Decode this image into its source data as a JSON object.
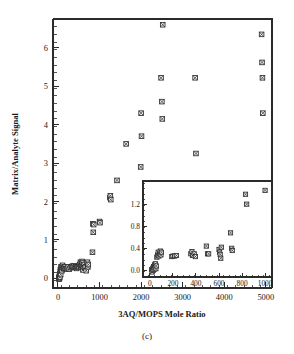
{
  "figure": {
    "caption": "(c)",
    "background_color": "#ffffff",
    "marker_color": "#2e2e2e",
    "marker_fill": "#f2f2f2",
    "axis_color": "#2b2b2b"
  },
  "chart_data": {
    "type": "scatter",
    "title": "",
    "xlabel": "3AQ/MOPS Mole Ratio",
    "ylabel": "Matrix/Analyte Signal",
    "xlim": [
      -120,
      5150
    ],
    "ylim": [
      -0.25,
      6.75
    ],
    "xticks": [
      0,
      1000,
      2000,
      3000,
      4000,
      5000
    ],
    "xticklabels": [
      "0",
      "1000",
      "2000",
      "3000",
      "4000",
      "5000"
    ],
    "yticks": [
      0,
      1,
      2,
      3,
      4,
      5,
      6
    ],
    "yticklabels": [
      "0",
      "1",
      "2",
      "3",
      "4",
      "5",
      "6"
    ],
    "minor_ticks": true,
    "grid": false,
    "legend": null,
    "marker": "crossed-square",
    "points": [
      [
        20,
        0.02
      ],
      [
        25,
        -0.02
      ],
      [
        30,
        0.05
      ],
      [
        35,
        0.0
      ],
      [
        40,
        0.08
      ],
      [
        45,
        0.03
      ],
      [
        50,
        0.12
      ],
      [
        55,
        0.18
      ],
      [
        60,
        0.22
      ],
      [
        65,
        0.1
      ],
      [
        70,
        0.26
      ],
      [
        75,
        0.3
      ],
      [
        85,
        0.24
      ],
      [
        95,
        0.2
      ],
      [
        100,
        0.3
      ],
      [
        110,
        0.34
      ],
      [
        120,
        0.28
      ],
      [
        140,
        0.26
      ],
      [
        160,
        0.3
      ],
      [
        180,
        0.25
      ],
      [
        200,
        0.25
      ],
      [
        215,
        0.26
      ],
      [
        240,
        0.3
      ],
      [
        270,
        0.24
      ],
      [
        300,
        0.28
      ],
      [
        330,
        0.3
      ],
      [
        350,
        0.32
      ],
      [
        370,
        0.3
      ],
      [
        390,
        0.33
      ],
      [
        410,
        0.28
      ],
      [
        430,
        0.3
      ],
      [
        450,
        0.26
      ],
      [
        470,
        0.3
      ],
      [
        490,
        0.31
      ],
      [
        500,
        0.3
      ],
      [
        520,
        0.36
      ],
      [
        540,
        0.42
      ],
      [
        550,
        0.3
      ],
      [
        560,
        0.38
      ],
      [
        570,
        0.34
      ],
      [
        580,
        0.44
      ],
      [
        590,
        0.4
      ],
      [
        600,
        0.22
      ],
      [
        610,
        0.3
      ],
      [
        620,
        0.36
      ],
      [
        640,
        0.28
      ],
      [
        660,
        0.3
      ],
      [
        680,
        0.2
      ],
      [
        700,
        0.4
      ],
      [
        710,
        0.42
      ],
      [
        720,
        0.3
      ],
      [
        730,
        0.36
      ],
      [
        830,
        0.68
      ],
      [
        840,
        1.42
      ],
      [
        850,
        1.2
      ],
      [
        860,
        1.4
      ],
      [
        1000,
        1.48
      ],
      [
        1010,
        1.45
      ],
      [
        1250,
        2.1
      ],
      [
        1260,
        2.15
      ],
      [
        1270,
        2.05
      ],
      [
        1420,
        2.55
      ],
      [
        1640,
        3.5
      ],
      [
        1990,
        2.9
      ],
      [
        2000,
        4.3
      ],
      [
        2010,
        3.7
      ],
      [
        2480,
        5.22
      ],
      [
        2500,
        4.6
      ],
      [
        2510,
        4.15
      ],
      [
        2520,
        6.6
      ],
      [
        3300,
        5.22
      ],
      [
        3320,
        3.25
      ],
      [
        4900,
        6.35
      ],
      [
        4910,
        5.62
      ],
      [
        4920,
        5.22
      ],
      [
        4930,
        4.3
      ]
    ]
  },
  "inset": {
    "type": "scatter",
    "xlabel": "",
    "ylabel": "",
    "xlim": [
      -60,
      1060
    ],
    "ylim": [
      -0.12,
      1.62
    ],
    "xticks": [
      0,
      200,
      400,
      600,
      800,
      1000
    ],
    "xticklabels": [
      "0",
      "200",
      "400",
      "600",
      "800",
      "1000"
    ],
    "yticks": [
      0.0,
      0.4,
      0.8,
      1.2
    ],
    "yticklabels": [
      "0.0",
      "0.4",
      "0.8",
      "1.2"
    ],
    "minor_ticks": true,
    "grid": false,
    "marker": "crossed-square",
    "points": [
      [
        15,
        0.01
      ],
      [
        20,
        -0.03
      ],
      [
        25,
        0.04
      ],
      [
        28,
        0.0
      ],
      [
        32,
        0.07
      ],
      [
        36,
        0.02
      ],
      [
        40,
        0.1
      ],
      [
        44,
        0.05
      ],
      [
        48,
        0.12
      ],
      [
        52,
        0.03
      ],
      [
        55,
        0.08
      ],
      [
        60,
        0.24
      ],
      [
        66,
        0.28
      ],
      [
        72,
        0.33
      ],
      [
        78,
        0.26
      ],
      [
        84,
        0.3
      ],
      [
        90,
        0.35
      ],
      [
        96,
        0.28
      ],
      [
        100,
        0.33
      ],
      [
        190,
        0.25
      ],
      [
        200,
        0.26
      ],
      [
        215,
        0.26
      ],
      [
        230,
        0.27
      ],
      [
        355,
        0.3
      ],
      [
        365,
        0.34
      ],
      [
        370,
        0.27
      ],
      [
        385,
        0.3
      ],
      [
        395,
        0.25
      ],
      [
        490,
        0.44
      ],
      [
        500,
        0.3
      ],
      [
        510,
        0.3
      ],
      [
        600,
        0.38
      ],
      [
        605,
        0.33
      ],
      [
        610,
        0.29
      ],
      [
        615,
        0.22
      ],
      [
        620,
        0.42
      ],
      [
        700,
        0.68
      ],
      [
        710,
        0.4
      ],
      [
        715,
        0.36
      ],
      [
        830,
        1.38
      ],
      [
        840,
        1.2
      ],
      [
        1000,
        1.45
      ]
    ]
  }
}
